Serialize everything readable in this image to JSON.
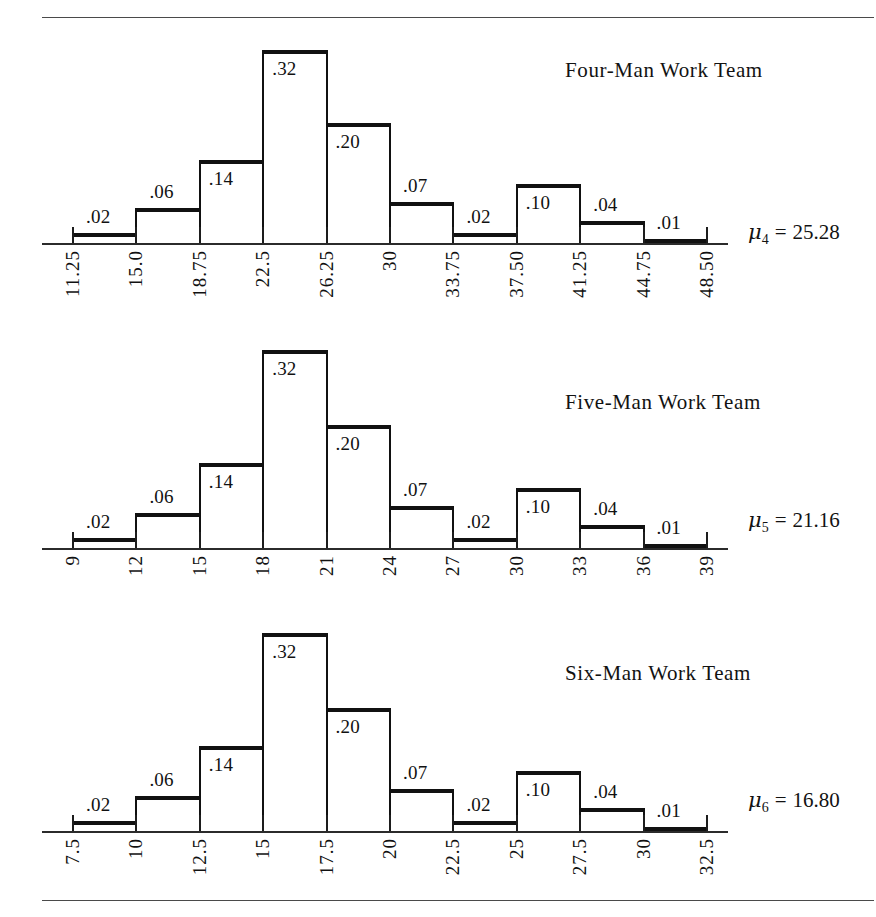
{
  "figure": {
    "rules": {
      "top": true,
      "bottom": true
    },
    "panel_count": 3
  },
  "chart_data": [
    {
      "type": "bar",
      "title": "Four-Man Work Team",
      "xlabel": "",
      "ylabel": "",
      "ylim": [
        0,
        0.32
      ],
      "grid": false,
      "legend": "none",
      "mean_symbol": "μ",
      "mean_subscript": "4",
      "mean_equals": "=",
      "mean_value": "25.28",
      "categories": [
        "11.25",
        "15.0",
        "18.75",
        "22.5",
        "26.25",
        "30",
        "33.75",
        "37.50",
        "41.25",
        "44.75",
        "48.50"
      ],
      "values": [
        0.02,
        0.06,
        0.14,
        0.32,
        0.2,
        0.07,
        0.02,
        0.1,
        0.04,
        0.01
      ],
      "value_labels": [
        ".02",
        ".06",
        ".14",
        ".32",
        ".20",
        ".07",
        ".02",
        ".10",
        ".04",
        ".01"
      ],
      "label_position": [
        "above",
        "above",
        "inside",
        "inside",
        "inside",
        "above",
        "above",
        "inside",
        "above",
        "above"
      ]
    },
    {
      "type": "bar",
      "title": "Five-Man Work Team",
      "xlabel": "",
      "ylabel": "",
      "ylim": [
        0,
        0.32
      ],
      "grid": false,
      "legend": "none",
      "mean_symbol": "μ",
      "mean_subscript": "5",
      "mean_equals": "=",
      "mean_value": "21.16",
      "categories": [
        "9",
        "12",
        "15",
        "18",
        "21",
        "24",
        "27",
        "30",
        "33",
        "36",
        "39"
      ],
      "values": [
        0.02,
        0.06,
        0.14,
        0.32,
        0.2,
        0.07,
        0.02,
        0.1,
        0.04,
        0.01
      ],
      "value_labels": [
        ".02",
        ".06",
        ".14",
        ".32",
        ".20",
        ".07",
        ".02",
        ".10",
        ".04",
        ".01"
      ],
      "label_position": [
        "above",
        "above",
        "inside",
        "inside",
        "inside",
        "above",
        "above",
        "inside",
        "above",
        "above"
      ]
    },
    {
      "type": "bar",
      "title": "Six-Man Work Team",
      "xlabel": "",
      "ylabel": "",
      "ylim": [
        0,
        0.32
      ],
      "grid": false,
      "legend": "none",
      "mean_symbol": "μ",
      "mean_subscript": "6",
      "mean_equals": "=",
      "mean_value": "16.80",
      "categories": [
        "7.5",
        "10",
        "12.5",
        "15",
        "17.5",
        "20",
        "22.5",
        "25",
        "27.5",
        "30",
        "32.5"
      ],
      "values": [
        0.02,
        0.06,
        0.14,
        0.32,
        0.2,
        0.07,
        0.02,
        0.1,
        0.04,
        0.01
      ],
      "value_labels": [
        ".02",
        ".06",
        ".14",
        ".32",
        ".20",
        ".07",
        ".02",
        ".10",
        ".04",
        ".01"
      ],
      "label_position": [
        "above",
        "above",
        "inside",
        "inside",
        "inside",
        "above",
        "above",
        "inside",
        "above",
        "above"
      ]
    }
  ],
  "colors": {
    "ink": "#111111",
    "rule": "#4a4a4a",
    "background": "#ffffff"
  }
}
